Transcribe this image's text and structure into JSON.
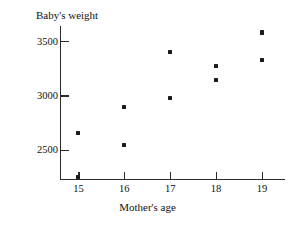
{
  "chart_data": {
    "type": "scatter",
    "title": "Baby's weight",
    "xlabel": "Mother's age",
    "ylabel": "",
    "xlim": [
      14.6,
      19.5
    ],
    "ylim": [
      2230,
      3640
    ],
    "grid": false,
    "legend": null,
    "xticks": [
      15,
      16,
      17,
      18,
      19
    ],
    "xtick_labels": [
      "15",
      "16",
      "17",
      "18",
      "19"
    ],
    "yticks": [
      2500,
      3000,
      3500
    ],
    "ytick_labels": [
      "2500",
      "3000",
      "3500"
    ],
    "points": [
      {
        "x": 15,
        "y": 2650
      },
      {
        "x": 15,
        "y": 2250
      },
      {
        "x": 16,
        "y": 2890
      },
      {
        "x": 16,
        "y": 2540
      },
      {
        "x": 17,
        "y": 3400
      },
      {
        "x": 17,
        "y": 2980
      },
      {
        "x": 18,
        "y": 3270
      },
      {
        "x": 18,
        "y": 3140
      },
      {
        "x": 19,
        "y": 3580
      },
      {
        "x": 19,
        "y": 3330
      }
    ],
    "marker": "square-dot",
    "marker_color": "#1b1b1b",
    "axis_color": "#2b2b2b",
    "background": "#ffffff"
  }
}
